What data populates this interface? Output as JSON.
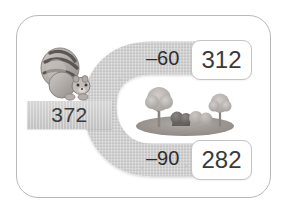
{
  "page": {
    "type": "math-worksheet-number-path",
    "frame_color": "#b9b9b9",
    "background": "#ffffff"
  },
  "road": {
    "color": "#cdcdcd",
    "shape": "c-shaped-u-turn-open-right",
    "start_label": "372",
    "branches": [
      {
        "id": "top",
        "operation_label": "–60",
        "result": "312"
      },
      {
        "id": "bottom",
        "operation_label": "–90",
        "result": "282"
      }
    ]
  },
  "start": {
    "value": "372",
    "bar_name": "start-road-bar"
  },
  "top_branch": {
    "operation": "–60",
    "answer": "312"
  },
  "bottom_branch": {
    "operation": "–90",
    "answer": "282"
  },
  "illustrations": {
    "squirrel": "squirrel-with-striped-tail",
    "scenery": "trees-and-bushes-on-grass"
  },
  "colors": {
    "road": "#cdcdcd",
    "road_dark": "#c2c2c2",
    "text": "#3a3a3a",
    "box_border": "#c4c4c4",
    "grass": "#9a9a9a",
    "tree": "#b5b0ad"
  }
}
